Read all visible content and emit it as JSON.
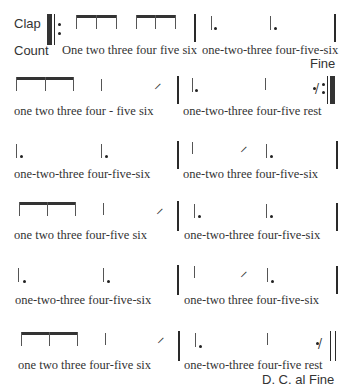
{
  "labels": {
    "clap": "Clap",
    "count": "Count",
    "fine": "Fine",
    "dc_al_fine": "D. C. al Fine"
  },
  "time_signature": "6/8 (implied)",
  "rows": [
    {
      "measures": [
        {
          "notes": "two beamed eighth-note triplets",
          "count": "One two three four five six"
        },
        {
          "notes": "dotted quarter, dotted quarter",
          "count": "one-two-three four-five-six"
        }
      ]
    },
    {
      "measures": [
        {
          "notes": "three beamed eighths, quarter, eighth",
          "count": "one two three  four - five  six"
        },
        {
          "notes": "dotted quarter, quarter, eighth rest",
          "count": "one-two-three four-five rest"
        }
      ]
    },
    {
      "measures": [
        {
          "notes": "dotted quarter, dotted quarter",
          "count": "one-two-three  four-five-six"
        },
        {
          "notes": "quarter, eighth, dotted quarter",
          "count": "one-two three four-five-six"
        }
      ]
    },
    {
      "measures": [
        {
          "notes": "three beamed eighths, quarter, eighth",
          "count": "one two three  four-five  six"
        },
        {
          "notes": "dotted quarter, dotted quarter",
          "count": "one-two-three four-five-six"
        }
      ]
    },
    {
      "measures": [
        {
          "notes": "dotted quarter, dotted quarter",
          "count": "one-two-three  four-five-six"
        },
        {
          "notes": "quarter, eighth, dotted quarter",
          "count": "one-two three  four-five-six"
        }
      ]
    },
    {
      "measures": [
        {
          "notes": "three beamed eighths, quarter, eighth",
          "count": "one two three  four-five  six"
        },
        {
          "notes": "dotted quarter, quarter, eighth rest",
          "count": "one-two-three four-five rest"
        }
      ]
    }
  ],
  "symbols": {
    "eighth_flag": "𝅘𝅥𝅮",
    "rest": "𝄾"
  }
}
